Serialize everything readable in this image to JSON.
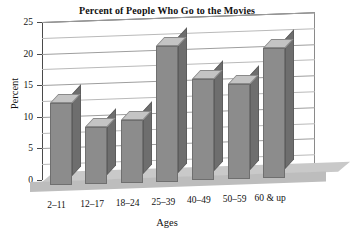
{
  "chart_data": {
    "type": "bar",
    "title": "Percent of People Who Go to the Movies",
    "xlabel": "Ages",
    "ylabel": "Percent",
    "categories": [
      "2–11",
      "12–17",
      "18–24",
      "25–39",
      "40–49",
      "50–59",
      "60 & up"
    ],
    "values": [
      13,
      9,
      10,
      21.5,
      16,
      15,
      20.5
    ],
    "ylim": [
      0,
      25
    ],
    "ytick_labels": [
      "0",
      "5",
      "10",
      "15",
      "20",
      "25"
    ],
    "ytick_values": [
      0,
      5,
      10,
      15,
      20,
      25
    ],
    "minor_gridline_values": [
      2.5,
      7.5,
      12.5,
      17.5,
      22.5
    ],
    "grid": true,
    "legend": "none",
    "style": "3d-column",
    "colors": {
      "bar_front": "#8c8c8c",
      "bar_side": "#6e6e6e",
      "bar_top": "#c4c4c4",
      "floor": "#c9c9c9",
      "gridline": "#b9b9b9",
      "axis": "#4a4a4a",
      "background": "#ffffff",
      "text": "#111111"
    }
  }
}
